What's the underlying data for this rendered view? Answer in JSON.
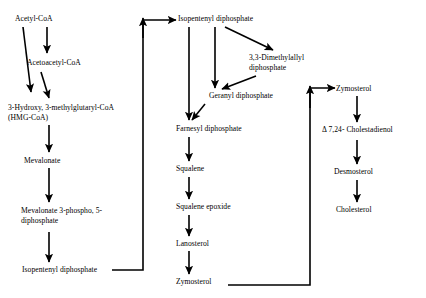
{
  "diagram": {
    "type": "flowchart",
    "background_color": "#ffffff",
    "line_color": "#000000",
    "text_color": "#000000"
  },
  "nodes": {
    "acetyl_coa": "Acetyl-CoA",
    "acetoacetyl_coa": "Acetoacetyl-CoA",
    "hmg_coa_line1": "3-Hydroxy, 3-methylglutaryl-CoA",
    "hmg_coa_line2": "(HMG-CoA)",
    "mevalonate": "Mevalonate",
    "mevalonate_phospho_line1": "Mevalonate 3-phospho, 5-",
    "mevalonate_phospho_line2": "diphosphate",
    "isopentenyl_diphosphate_left": "Isopentenyl diphosphate",
    "isopentenyl_diphosphate_top": "Isopentenyl diphosphate",
    "dimethylallyl_line1": "3,3-Dimethylallyl",
    "dimethylallyl_line2": "diphosphate",
    "geranyl_diphosphate": "Geranyl diphosphate",
    "farnesyl_diphosphate": "Farnesyl diphosphate",
    "squalene": "Squalene",
    "squalene_epoxide": "Squalene epoxide",
    "lanosterol": "Lanosterol",
    "zymosterol_middle": "Zymosterol",
    "zymosterol_right": "Zymosterol",
    "cholestadienol": "Δ 7,24- Cholestadienol",
    "desmosterol": "Desmosterol",
    "cholesterol": "Cholesterol"
  }
}
